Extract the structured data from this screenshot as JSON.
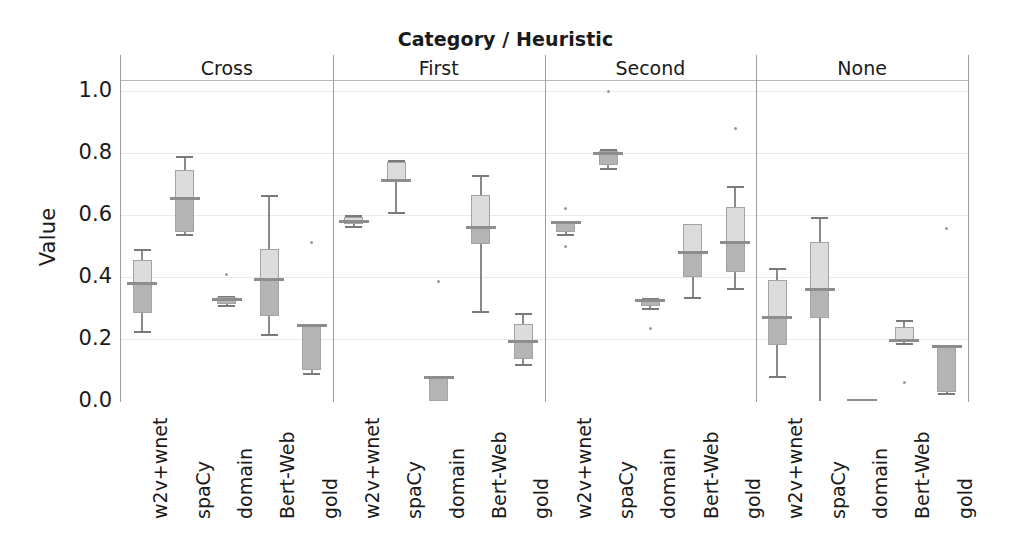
{
  "chart_data": {
    "type": "box",
    "title": "Category / Heuristic",
    "xlabel": "",
    "ylabel": "Value",
    "ylim": [
      0.0,
      1.0
    ],
    "yticks": [
      "0.0",
      "0.2",
      "0.4",
      "0.6",
      "0.8",
      "1.0"
    ],
    "ytick_values": [
      0.0,
      0.2,
      0.4,
      0.6,
      0.8,
      1.0
    ],
    "grid": true,
    "legend": "none",
    "facet_label": "Category / Heuristic",
    "facets": [
      "Cross",
      "First",
      "Second",
      "None"
    ],
    "categories": [
      "w2v+wnet",
      "spaCy",
      "domain",
      "Bert-Web",
      "gold"
    ],
    "panels": [
      {
        "name": "Cross",
        "boxes": [
          {
            "category": "w2v+wnet",
            "whisker_low": 0.225,
            "q1": 0.285,
            "median": 0.38,
            "q3": 0.455,
            "whisker_high": 0.49,
            "fliers": []
          },
          {
            "category": "spaCy",
            "whisker_low": 0.54,
            "q1": 0.545,
            "median": 0.655,
            "q3": 0.745,
            "whisker_high": 0.79,
            "fliers": []
          },
          {
            "category": "domain",
            "whisker_low": 0.31,
            "q1": 0.312,
            "median": 0.33,
            "q3": 0.335,
            "whisker_high": 0.338,
            "fliers": [
              0.408
            ]
          },
          {
            "category": "Bert-Web",
            "whisker_low": 0.215,
            "q1": 0.275,
            "median": 0.395,
            "q3": 0.49,
            "whisker_high": 0.665,
            "fliers": []
          },
          {
            "category": "gold",
            "whisker_low": 0.09,
            "q1": 0.1,
            "median": 0.245,
            "q3": 0.248,
            "whisker_high": 0.25,
            "fliers": [
              0.51
            ]
          }
        ]
      },
      {
        "name": "First",
        "boxes": [
          {
            "category": "w2v+wnet",
            "whisker_low": 0.565,
            "q1": 0.572,
            "median": 0.58,
            "q3": 0.592,
            "whisker_high": 0.6,
            "fliers": []
          },
          {
            "category": "spaCy",
            "whisker_low": 0.61,
            "q1": 0.705,
            "median": 0.712,
            "q3": 0.772,
            "whisker_high": 0.778,
            "fliers": []
          },
          {
            "category": "domain",
            "whisker_low": 0.0,
            "q1": 0.0,
            "median": 0.078,
            "q3": 0.08,
            "whisker_high": 0.082,
            "fliers": [
              0.385
            ]
          },
          {
            "category": "Bert-Web",
            "whisker_low": 0.29,
            "q1": 0.505,
            "median": 0.562,
            "q3": 0.665,
            "whisker_high": 0.73,
            "fliers": []
          },
          {
            "category": "gold",
            "whisker_low": 0.12,
            "q1": 0.135,
            "median": 0.195,
            "q3": 0.248,
            "whisker_high": 0.285,
            "fliers": []
          }
        ]
      },
      {
        "name": "Second",
        "boxes": [
          {
            "category": "w2v+wnet",
            "whisker_low": 0.54,
            "q1": 0.545,
            "median": 0.578,
            "q3": 0.58,
            "whisker_high": 0.582,
            "fliers": [
              0.62,
              0.5
            ]
          },
          {
            "category": "spaCy",
            "whisker_low": 0.752,
            "q1": 0.762,
            "median": 0.8,
            "q3": 0.805,
            "whisker_high": 0.812,
            "fliers": [
              1.0
            ]
          },
          {
            "category": "domain",
            "whisker_low": 0.3,
            "q1": 0.305,
            "median": 0.325,
            "q3": 0.33,
            "whisker_high": 0.332,
            "fliers": [
              0.235
            ]
          },
          {
            "category": "Bert-Web",
            "whisker_low": 0.335,
            "q1": 0.4,
            "median": 0.48,
            "q3": 0.57,
            "whisker_high": 0.572,
            "fliers": []
          },
          {
            "category": "gold",
            "whisker_low": 0.365,
            "q1": 0.415,
            "median": 0.512,
            "q3": 0.625,
            "whisker_high": 0.692,
            "fliers": [
              0.878
            ]
          }
        ]
      },
      {
        "name": "None",
        "boxes": [
          {
            "category": "w2v+wnet",
            "whisker_low": 0.082,
            "q1": 0.18,
            "median": 0.272,
            "q3": 0.39,
            "whisker_high": 0.428,
            "fliers": []
          },
          {
            "category": "spaCy",
            "whisker_low": 0.0,
            "q1": 0.268,
            "median": 0.362,
            "q3": 0.512,
            "whisker_high": 0.595,
            "fliers": []
          },
          {
            "category": "domain",
            "whisker_low": 0.0,
            "q1": 0.0,
            "median": 0.002,
            "q3": 0.004,
            "whisker_high": 0.005,
            "fliers": []
          },
          {
            "category": "Bert-Web",
            "whisker_low": 0.188,
            "q1": 0.192,
            "median": 0.198,
            "q3": 0.24,
            "whisker_high": 0.262,
            "fliers": [
              0.06
            ]
          },
          {
            "category": "gold",
            "whisker_low": 0.025,
            "q1": 0.03,
            "median": 0.178,
            "q3": 0.18,
            "whisker_high": 0.182,
            "fliers": [
              0.555
            ]
          }
        ]
      }
    ]
  }
}
